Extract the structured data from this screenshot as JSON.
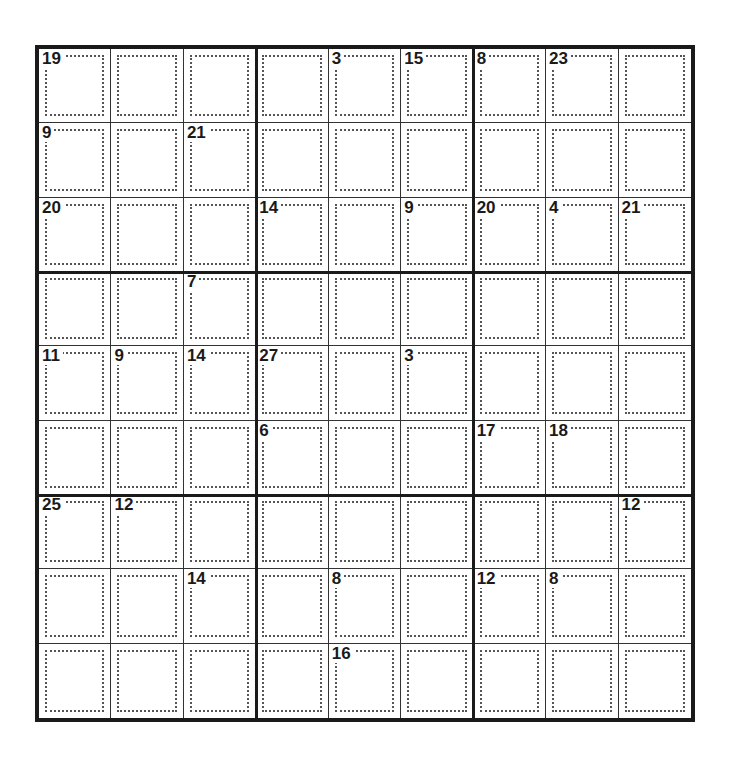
{
  "puzzle": {
    "type": "killer-sudoku",
    "rows": 9,
    "cols": 9,
    "cages": [
      {
        "sum": "19",
        "cells": [
          [
            0,
            0
          ],
          [
            0,
            1
          ],
          [
            0,
            2
          ],
          [
            0,
            3
          ]
        ]
      },
      {
        "sum": "3",
        "cells": [
          [
            0,
            4
          ],
          [
            1,
            4
          ]
        ]
      },
      {
        "sum": "15",
        "cells": [
          [
            0,
            5
          ],
          [
            1,
            5
          ]
        ]
      },
      {
        "sum": "8",
        "cells": [
          [
            0,
            6
          ],
          [
            1,
            6
          ]
        ]
      },
      {
        "sum": "23",
        "cells": [
          [
            0,
            7
          ],
          [
            0,
            8
          ],
          [
            1,
            7
          ],
          [
            1,
            8
          ]
        ]
      },
      {
        "sum": "9",
        "cells": [
          [
            1,
            0
          ],
          [
            1,
            1
          ]
        ]
      },
      {
        "sum": "21",
        "cells": [
          [
            1,
            2
          ],
          [
            1,
            3
          ],
          [
            2,
            2
          ]
        ]
      },
      {
        "sum": "20",
        "cells": [
          [
            2,
            0
          ],
          [
            2,
            1
          ],
          [
            3,
            0
          ],
          [
            3,
            1
          ]
        ]
      },
      {
        "sum": "14",
        "cells": [
          [
            2,
            3
          ],
          [
            2,
            4
          ],
          [
            3,
            4
          ]
        ]
      },
      {
        "sum": "9",
        "cells": [
          [
            2,
            5
          ],
          [
            3,
            5
          ]
        ]
      },
      {
        "sum": "20",
        "cells": [
          [
            2,
            6
          ],
          [
            3,
            6
          ],
          [
            4,
            6
          ],
          [
            4,
            7
          ]
        ]
      },
      {
        "sum": "4",
        "cells": [
          [
            2,
            7
          ],
          [
            3,
            7
          ]
        ]
      },
      {
        "sum": "21",
        "cells": [
          [
            2,
            8
          ],
          [
            3,
            8
          ],
          [
            4,
            8
          ]
        ]
      },
      {
        "sum": "7",
        "cells": [
          [
            3,
            2
          ],
          [
            3,
            3
          ]
        ]
      },
      {
        "sum": "11",
        "cells": [
          [
            4,
            0
          ],
          [
            5,
            0
          ]
        ]
      },
      {
        "sum": "9",
        "cells": [
          [
            4,
            1
          ],
          [
            5,
            1
          ]
        ]
      },
      {
        "sum": "14",
        "cells": [
          [
            4,
            2
          ],
          [
            5,
            2
          ]
        ]
      },
      {
        "sum": "27",
        "cells": [
          [
            4,
            3
          ],
          [
            4,
            4
          ],
          [
            5,
            4
          ],
          [
            6,
            4
          ]
        ]
      },
      {
        "sum": "3",
        "cells": [
          [
            4,
            5
          ],
          [
            5,
            5
          ]
        ]
      },
      {
        "sum": "6",
        "cells": [
          [
            5,
            3
          ],
          [
            6,
            3
          ]
        ]
      },
      {
        "sum": "17",
        "cells": [
          [
            5,
            6
          ],
          [
            6,
            5
          ],
          [
            6,
            6
          ]
        ]
      },
      {
        "sum": "18",
        "cells": [
          [
            5,
            7
          ],
          [
            5,
            8
          ],
          [
            6,
            7
          ]
        ]
      },
      {
        "sum": "25",
        "cells": [
          [
            6,
            0
          ],
          [
            7,
            0
          ],
          [
            8,
            0
          ],
          [
            8,
            1
          ]
        ]
      },
      {
        "sum": "12",
        "cells": [
          [
            6,
            1
          ],
          [
            7,
            1
          ]
        ]
      },
      {
        "sum": "12",
        "cells": [
          [
            6,
            8
          ],
          [
            7,
            8
          ]
        ]
      },
      {
        "sum": "14",
        "cells": [
          [
            6,
            2
          ],
          [
            7,
            2
          ],
          [
            8,
            2
          ]
        ]
      },
      {
        "sum": "8",
        "cells": [
          [
            7,
            4
          ],
          [
            7,
            5
          ]
        ]
      },
      {
        "sum": "12",
        "cells": [
          [
            7,
            6
          ],
          [
            8,
            6
          ]
        ]
      },
      {
        "sum": "8",
        "cells": [
          [
            7,
            7
          ],
          [
            8,
            7
          ],
          [
            8,
            8
          ]
        ]
      },
      {
        "sum": "16",
        "cells": [
          [
            8,
            4
          ],
          [
            8,
            5
          ]
        ]
      }
    ],
    "labels": [
      {
        "row": 0,
        "col": 0,
        "sum": "19"
      },
      {
        "row": 0,
        "col": 4,
        "sum": "3"
      },
      {
        "row": 0,
        "col": 5,
        "sum": "15"
      },
      {
        "row": 0,
        "col": 6,
        "sum": "8"
      },
      {
        "row": 0,
        "col": 7,
        "sum": "23"
      },
      {
        "row": 1,
        "col": 0,
        "sum": "9"
      },
      {
        "row": 1,
        "col": 2,
        "sum": "21"
      },
      {
        "row": 2,
        "col": 0,
        "sum": "20"
      },
      {
        "row": 2,
        "col": 3,
        "sum": "14"
      },
      {
        "row": 2,
        "col": 5,
        "sum": "9"
      },
      {
        "row": 2,
        "col": 6,
        "sum": "20"
      },
      {
        "row": 2,
        "col": 7,
        "sum": "4"
      },
      {
        "row": 2,
        "col": 8,
        "sum": "21"
      },
      {
        "row": 3,
        "col": 2,
        "sum": "7"
      },
      {
        "row": 4,
        "col": 0,
        "sum": "11"
      },
      {
        "row": 4,
        "col": 1,
        "sum": "9"
      },
      {
        "row": 4,
        "col": 2,
        "sum": "14"
      },
      {
        "row": 4,
        "col": 3,
        "sum": "27"
      },
      {
        "row": 4,
        "col": 5,
        "sum": "3"
      },
      {
        "row": 5,
        "col": 3,
        "sum": "6"
      },
      {
        "row": 5,
        "col": 6,
        "sum": "17"
      },
      {
        "row": 5,
        "col": 7,
        "sum": "18"
      },
      {
        "row": 6,
        "col": 0,
        "sum": "25"
      },
      {
        "row": 6,
        "col": 1,
        "sum": "12"
      },
      {
        "row": 6,
        "col": 8,
        "sum": "12"
      },
      {
        "row": 7,
        "col": 2,
        "sum": "14"
      },
      {
        "row": 7,
        "col": 4,
        "sum": "8"
      },
      {
        "row": 7,
        "col": 6,
        "sum": "12"
      },
      {
        "row": 7,
        "col": 7,
        "sum": "8"
      },
      {
        "row": 8,
        "col": 4,
        "sum": "16"
      }
    ]
  }
}
